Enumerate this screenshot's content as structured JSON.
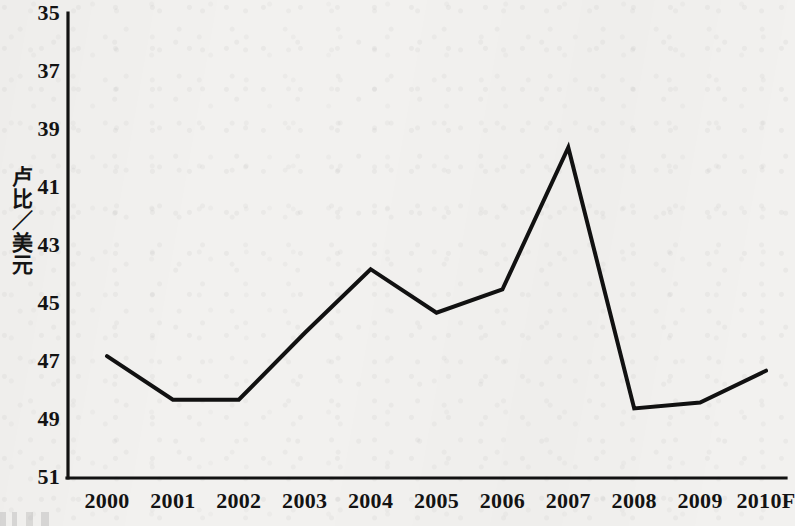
{
  "chart_data": {
    "type": "line",
    "title": "",
    "subtitle": "",
    "xlabel": "",
    "ylabel": "卢比／美元",
    "categories": [
      "2000",
      "2001",
      "2002",
      "2003",
      "2004",
      "2005",
      "2006",
      "2007",
      "2008",
      "2009",
      "2010F"
    ],
    "values": [
      46.8,
      48.3,
      48.3,
      46.0,
      43.8,
      45.3,
      44.5,
      39.6,
      48.6,
      48.4,
      47.3
    ],
    "series": [
      {
        "name": "卢比／美元",
        "values": [
          46.8,
          48.3,
          48.3,
          46.0,
          43.8,
          45.3,
          44.5,
          39.6,
          48.6,
          48.4,
          47.3
        ]
      }
    ],
    "ylim": [
      35,
      51
    ],
    "y_axis_inverted": true,
    "y_ticks": [
      35,
      37,
      39,
      41,
      43,
      45,
      47,
      49,
      51
    ],
    "y_tick_labels": [
      "35",
      "37",
      "39",
      "41",
      "43",
      "45",
      "47",
      "49",
      "51"
    ],
    "x_tick_labels": [
      "2000",
      "2001",
      "2002",
      "2003",
      "2004",
      "2005",
      "2006",
      "2007",
      "2008",
      "2009",
      "2010F"
    ],
    "grid": false,
    "legend": "none",
    "line_color": "#111111",
    "line_width": 4,
    "markers": "none",
    "annotations": []
  },
  "style": {
    "background_color": "#f2f1ef",
    "axis_color": "#121212",
    "text_color": "#131313"
  }
}
